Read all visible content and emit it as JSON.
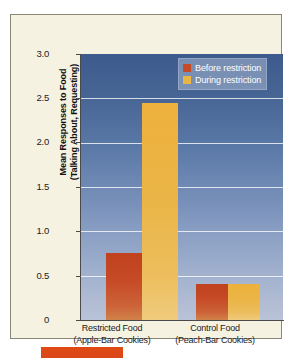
{
  "chart_data": {
    "type": "bar",
    "title": "",
    "xlabel": "",
    "ylabel": "Mean Responses to Food (Talking About, Requesting)",
    "ylabel_line1": "Mean Responses to Food",
    "ylabel_line2": "(Talking About, Requesting)",
    "ylim": [
      0,
      3.0
    ],
    "ytick_labels": [
      "3.0",
      "2.5",
      "2.0",
      "1.5",
      "1.0",
      "0.5",
      "0"
    ],
    "ytick_values": [
      3.0,
      2.5,
      2.0,
      1.5,
      1.0,
      0.5,
      0
    ],
    "grid": true,
    "grid_axis": "y",
    "legend_position": "top-right",
    "categories": [
      "Restricted Food (Apple-Bar Cookies)",
      "Control Food (Peach-Bar Cookies)"
    ],
    "category_labels": [
      {
        "line1": "Restricted Food",
        "line2": "(Apple-Bar Cookies)"
      },
      {
        "line1": "Control Food",
        "line2": "(Peach-Bar Cookies)"
      }
    ],
    "series": [
      {
        "name": "Before restriction",
        "color": "#C64A26",
        "values": [
          0.76,
          0.41
        ]
      },
      {
        "name": "During restriction",
        "color": "#EAB547",
        "values": [
          2.45,
          0.41
        ]
      }
    ]
  },
  "legend": {
    "items": [
      {
        "label": "Before restriction",
        "color": "#C64A26"
      },
      {
        "label": "During restriction",
        "color": "#EAB547"
      }
    ]
  },
  "colors": {
    "series_before": "#C64A26",
    "series_during": "#EAB547",
    "plot_background_top": "#3C5A8C",
    "plot_background_bottom": "#B8C3D8",
    "panel_background": "#F6F2E2",
    "accent_bar": "#DC4715",
    "gridline": "#FFFFFF"
  }
}
